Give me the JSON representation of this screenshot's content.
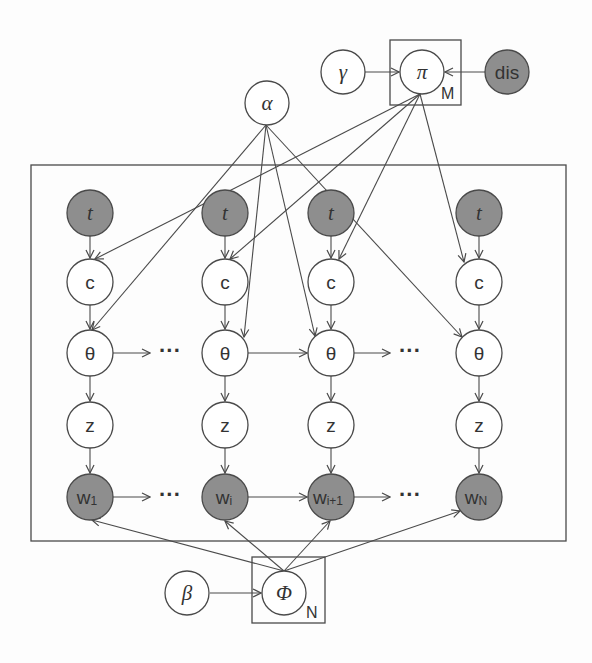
{
  "diagram": {
    "type": "probabilistic graphical model (plate notation)",
    "colors": {
      "observed_fill": "#8e8e8e",
      "latent_fill": "#ffffff",
      "stroke": "#4a4a4a",
      "background": "#fdfdfd"
    },
    "nodes": {
      "gamma": {
        "label": "γ",
        "observed": false
      },
      "pi": {
        "label": "π",
        "observed": false
      },
      "dis": {
        "label": "dis",
        "observed": true
      },
      "alpha": {
        "label": "α",
        "observed": false
      },
      "beta": {
        "label": "β",
        "observed": false
      },
      "phi": {
        "label": "Φ",
        "observed": false
      },
      "columns": [
        {
          "t": "t",
          "c": "c",
          "theta": "θ",
          "z": "z",
          "w": "w",
          "w_sub": "1"
        },
        {
          "t": "t",
          "c": "c",
          "theta": "θ",
          "z": "z",
          "w": "w",
          "w_sub": "i"
        },
        {
          "t": "t",
          "c": "c",
          "theta": "θ",
          "z": "z",
          "w": "w",
          "w_sub": "i+1"
        },
        {
          "t": "t",
          "c": "c",
          "theta": "θ",
          "z": "z",
          "w": "w",
          "w_sub": "N"
        }
      ]
    },
    "plates": {
      "m_plate": {
        "label": "M",
        "contains": [
          "pi"
        ]
      },
      "n_plate": {
        "label": "N",
        "contains": [
          "phi"
        ]
      },
      "main_plate": {
        "label": "",
        "contains": [
          "t",
          "c",
          "theta",
          "z",
          "w"
        ]
      }
    },
    "ellipsis": "···",
    "edges": [
      [
        "gamma",
        "pi"
      ],
      [
        "dis",
        "pi"
      ],
      [
        "pi",
        "c_1"
      ],
      [
        "pi",
        "c_i"
      ],
      [
        "pi",
        "c_i+1"
      ],
      [
        "pi",
        "c_N"
      ],
      [
        "alpha",
        "theta_1"
      ],
      [
        "alpha",
        "theta_i"
      ],
      [
        "alpha",
        "theta_i+1"
      ],
      [
        "alpha",
        "theta_N"
      ],
      [
        "t",
        "c"
      ],
      [
        "c",
        "theta"
      ],
      [
        "theta",
        "z"
      ],
      [
        "z",
        "w"
      ],
      [
        "theta_1",
        "..."
      ],
      [
        "theta_i",
        "theta_i+1"
      ],
      [
        "theta_i+1",
        "..."
      ],
      [
        "w_1",
        "..."
      ],
      [
        "w_i",
        "w_i+1"
      ],
      [
        "w_i+1",
        "..."
      ],
      [
        "beta",
        "phi"
      ],
      [
        "phi",
        "w_1"
      ],
      [
        "phi",
        "w_i"
      ],
      [
        "phi",
        "w_i+1"
      ],
      [
        "phi",
        "w_N"
      ]
    ]
  }
}
